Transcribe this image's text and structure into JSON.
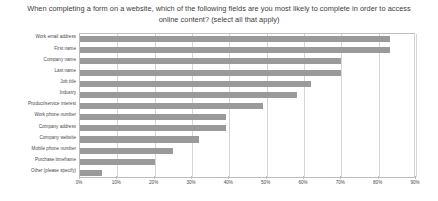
{
  "chart_data": {
    "type": "bar",
    "orientation": "horizontal",
    "title": "When completing a form on a website, which of the following fields are you most likely to complete in order to access online content? (select all that apply)",
    "xlabel": "",
    "ylabel": "",
    "xlim": [
      0,
      90
    ],
    "grid": true,
    "legend": null,
    "bar_color": "#9a9a9a",
    "xtick_labels": [
      "0%",
      "10%",
      "20%",
      "30%",
      "40%",
      "50%",
      "60%",
      "70%",
      "80%",
      "90%"
    ],
    "xtick_values": [
      0,
      10,
      20,
      30,
      40,
      50,
      60,
      70,
      80,
      90
    ],
    "categories": [
      "Work email address",
      "First name",
      "Company name",
      "Last name",
      "Job title",
      "Industry",
      "Product/service interest",
      "Work phone number",
      "Company address",
      "Company website",
      "Mobile phone number",
      "Purchase timeframe",
      "Other (please specify)"
    ],
    "values": [
      83,
      83,
      70,
      70,
      62,
      58,
      49,
      39,
      39,
      32,
      25,
      20,
      6
    ]
  }
}
